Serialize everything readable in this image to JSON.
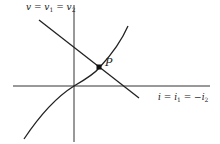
{
  "diagram": {
    "type": "graphical-solution",
    "axes": {
      "y_label": {
        "main": "v = v",
        "sub1": "1",
        "mid": " = v",
        "sub2": "2"
      },
      "x_label": {
        "main": "i = i",
        "sub1": "1",
        "mid": " = −i",
        "sub2": "2"
      }
    },
    "curves": [
      {
        "name": "load-line",
        "shape": "straight line, negative slope"
      },
      {
        "name": "nonlinear-characteristic",
        "shape": "increasing curve through origin"
      }
    ],
    "intersection": {
      "label": "P"
    }
  }
}
